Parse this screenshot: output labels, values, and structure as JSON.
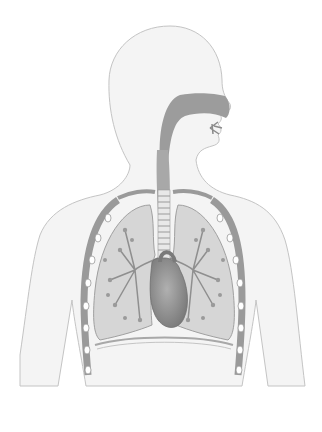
{
  "figure": {
    "background": "#ffffff",
    "colors": {
      "body_fill": "#f2f2f2",
      "body_outline": "#bdbdbd",
      "lung_fill": "#d3d3d3",
      "airway_fill": "#9a9a9a",
      "bronchi": "#8f8f8f",
      "heart_fill": "#8a8a8a",
      "rib_fill": "#ffffff",
      "rib_outline": "#9a9a9a"
    }
  }
}
